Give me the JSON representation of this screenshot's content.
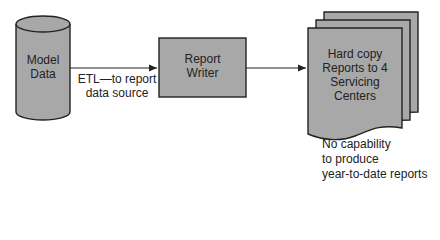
{
  "diagram": {
    "nodes": [
      {
        "id": "model-data",
        "shape": "cylinder",
        "lines": [
          "Model",
          "Data"
        ]
      },
      {
        "id": "report-writer",
        "shape": "rectangle",
        "lines": [
          "Report",
          "Writer"
        ]
      },
      {
        "id": "hard-copy-reports",
        "shape": "multi-document",
        "lines": [
          "Hard copy",
          "Reports to 4",
          "Servicing",
          "Centers"
        ]
      }
    ],
    "edges": [
      {
        "from": "model-data",
        "to": "report-writer",
        "label_lines": [
          "ETL—to report",
          "data source"
        ]
      },
      {
        "from": "report-writer",
        "to": "hard-copy-reports"
      }
    ],
    "note": {
      "lines": [
        "No capability",
        "to produce",
        "year-to-date reports"
      ]
    },
    "colors": {
      "fill": "#a8a8a8",
      "stroke": "#222222",
      "background": "#ffffff"
    }
  }
}
